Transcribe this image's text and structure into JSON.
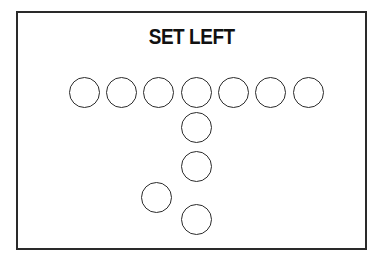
{
  "diagram": {
    "title": "SET LEFT",
    "type": "football-formation",
    "colors": {
      "stroke": "#2b2b2b",
      "background": "#ffffff",
      "text": "#111111"
    },
    "players": [
      {
        "role": "line-1",
        "cx": 84,
        "cy": 92
      },
      {
        "role": "line-2",
        "cx": 121,
        "cy": 92
      },
      {
        "role": "line-3",
        "cx": 158,
        "cy": 92
      },
      {
        "role": "line-center",
        "cx": 196,
        "cy": 92
      },
      {
        "role": "line-5",
        "cx": 233,
        "cy": 92
      },
      {
        "role": "line-6",
        "cx": 270,
        "cy": 92
      },
      {
        "role": "line-7",
        "cx": 308,
        "cy": 92
      },
      {
        "role": "quarterback",
        "cx": 196,
        "cy": 127
      },
      {
        "role": "fullback",
        "cx": 196,
        "cy": 166
      },
      {
        "role": "halfback-left",
        "cx": 156,
        "cy": 197
      },
      {
        "role": "tailback",
        "cx": 196,
        "cy": 219
      }
    ]
  }
}
